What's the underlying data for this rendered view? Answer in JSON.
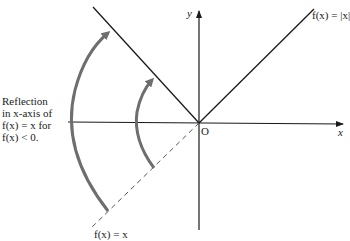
{
  "diagram": {
    "labels": {
      "y_axis": "y",
      "x_axis": "x",
      "origin": "O",
      "abs_function": "f(x) = |x|",
      "identity_function": "f(x) = x"
    },
    "annotation": {
      "lines": [
        "Reflection",
        "in x-axis of",
        "f(x) = x for",
        "f(x) < 0."
      ]
    },
    "colors": {
      "line": "#1a1a1a",
      "arrow": "#6e6e6e",
      "dashed": "#555555"
    }
  }
}
